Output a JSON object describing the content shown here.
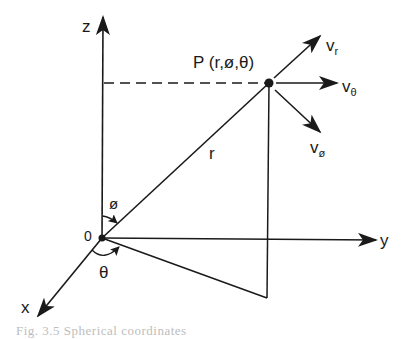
{
  "diagram": {
    "type": "spherical-coordinate-system",
    "colors": {
      "ink": "#1a1a1a",
      "background": "#ffffff",
      "caption": "#bdbdbd"
    },
    "axes": {
      "z": {
        "label": "z"
      },
      "y": {
        "label": "y"
      },
      "x": {
        "label": "x"
      }
    },
    "origin": {
      "label": "0"
    },
    "point": {
      "label": "P (r,ø,θ)"
    },
    "radius": {
      "label": "r"
    },
    "angles": {
      "phi": {
        "label": "ø"
      },
      "theta": {
        "label": "θ"
      }
    },
    "velocity_components": [
      {
        "base": "v",
        "sub": "r"
      },
      {
        "base": "v",
        "sub": "θ"
      },
      {
        "base": "v",
        "sub": "ø"
      }
    ],
    "caption": "Fig. 3.5  Spherical coordinates"
  }
}
